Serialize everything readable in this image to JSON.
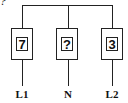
{
  "diagram": {
    "corner_mark": "?",
    "branches": [
      {
        "value": "7",
        "label": "L1"
      },
      {
        "value": "?",
        "label": "N"
      },
      {
        "value": "3",
        "label": "L2"
      }
    ]
  }
}
